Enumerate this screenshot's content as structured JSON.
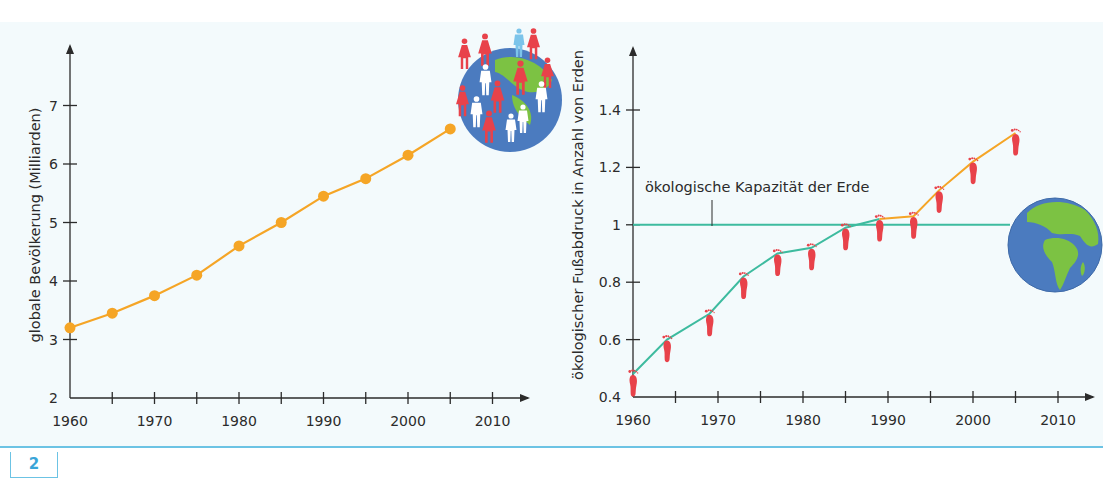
{
  "figure": {
    "number": "2"
  },
  "colors": {
    "panel_bg": "#f3fafc",
    "axis": "#2b2b2b",
    "population_line": "#f5a526",
    "footprint_below": "#3dbb9f",
    "footprint_above": "#f5a526",
    "capacity_line": "#3dbb9f",
    "footprint_marker": "#e8424a",
    "globe_ocean": "#4b7bbf",
    "globe_land": "#7cc243",
    "rule": "#6cc3e4"
  },
  "chart_data": [
    {
      "type": "line",
      "title": "",
      "xlabel": "",
      "ylabel": "globale Bevölkerung (Milliarden)",
      "x_ticks": [
        "1960",
        "1970",
        "1980",
        "1990",
        "2000",
        "2010"
      ],
      "y_ticks": [
        "2",
        "3",
        "4",
        "5",
        "6",
        "7"
      ],
      "xlim": [
        1960,
        2012
      ],
      "ylim": [
        2,
        7.8
      ],
      "grid": false,
      "series": [
        {
          "name": "globale Bevölkerung",
          "x": [
            1960,
            1965,
            1970,
            1975,
            1980,
            1985,
            1990,
            1995,
            2000,
            2005
          ],
          "values": [
            3.2,
            3.45,
            3.75,
            4.1,
            4.6,
            5.0,
            5.45,
            5.75,
            6.15,
            6.6
          ]
        }
      ],
      "decoration": "globe-with-people-icon"
    },
    {
      "type": "line",
      "title": "",
      "xlabel": "",
      "ylabel": "ökologischer Fußabdruck in Anzahl von Erden",
      "x_ticks": [
        "1960",
        "1970",
        "1980",
        "1990",
        "2000",
        "2010"
      ],
      "y_ticks": [
        "0.4",
        "0.6",
        "0.8",
        "1",
        "1.2",
        "1.4"
      ],
      "xlim": [
        1960,
        2012
      ],
      "ylim": [
        0.4,
        1.6
      ],
      "grid": false,
      "series": [
        {
          "name": "ökologischer Fußabdruck",
          "x": [
            1960,
            1964,
            1969,
            1973,
            1977,
            1981,
            1985,
            1989,
            1993,
            1996,
            2000,
            2005
          ],
          "values": [
            0.48,
            0.6,
            0.69,
            0.82,
            0.9,
            0.92,
            0.99,
            1.02,
            1.03,
            1.12,
            1.22,
            1.32
          ]
        },
        {
          "name": "ökologische Kapazität der Erde",
          "x": [
            1960,
            2010
          ],
          "values": [
            1.0,
            1.0
          ]
        }
      ],
      "annotations": [
        {
          "text": "ökologische Kapazität der Erde",
          "points_to": "capacity-line"
        }
      ],
      "decoration": "earth-globe-icon"
    }
  ]
}
